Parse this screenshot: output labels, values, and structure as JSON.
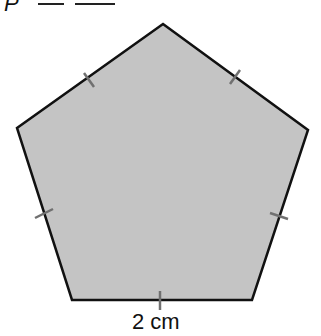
{
  "header": {
    "variable": "P",
    "equals_sign": "—"
  },
  "figure": {
    "shape": "regular pentagon",
    "fill_color": "#c4c4c4",
    "stroke_color": "#111111",
    "tick_color": "#707070",
    "side_label": "2 cm",
    "vertices": [
      [
        163,
        24
      ],
      [
        308,
        130
      ],
      [
        252,
        300
      ],
      [
        72,
        300
      ],
      [
        17,
        128
      ]
    ]
  }
}
